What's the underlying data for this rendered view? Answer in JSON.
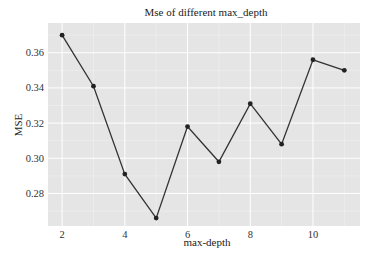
{
  "chart_data": {
    "type": "line",
    "title": "Mse of different max_depth",
    "xlabel": "max-depth",
    "ylabel": "MSE",
    "x": [
      2,
      3,
      4,
      5,
      6,
      7,
      8,
      9,
      10,
      11
    ],
    "series": [
      {
        "name": "MSE",
        "values": [
          0.37,
          0.341,
          0.291,
          0.266,
          0.318,
          0.298,
          0.331,
          0.308,
          0.356,
          0.35
        ]
      }
    ],
    "xticks": [
      2,
      4,
      6,
      8,
      10
    ],
    "yticks": [
      0.28,
      0.3,
      0.32,
      0.34,
      0.36
    ],
    "ytick_labels": [
      "0.28",
      "0.30",
      "0.32",
      "0.34",
      "0.36"
    ],
    "xlim": [
      1.55,
      11.5
    ],
    "ylim": [
      0.2615,
      0.3769
    ],
    "grid": true,
    "legend": false,
    "colors": {
      "plot_bg": "#e5e5e5",
      "grid": "#ffffff",
      "line": "#333333",
      "marker": "#222222"
    }
  }
}
